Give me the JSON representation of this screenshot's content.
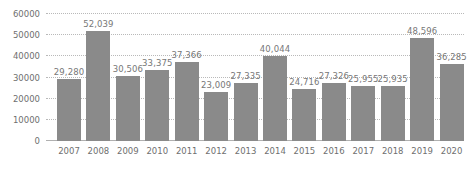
{
  "chart_data": {
    "type": "bar",
    "title": "",
    "xlabel": "",
    "ylabel": "",
    "grid": true,
    "legend": null,
    "ylim": [
      0,
      60000
    ],
    "yticks": [
      0,
      10000,
      20000,
      30000,
      40000,
      50000,
      60000
    ],
    "ytick_labels": [
      "0",
      "10000",
      "20000",
      "30000",
      "40000",
      "50000",
      "60000"
    ],
    "bar_color": "#8a8a8a",
    "label_color": "#777777",
    "grid_color": "#b9b9b9",
    "categories": [
      "2007",
      "2008",
      "2009",
      "2010",
      "2011",
      "2012",
      "2013",
      "2014",
      "2015",
      "2016",
      "2017",
      "2018",
      "2019",
      "2020"
    ],
    "values": [
      29280,
      52039,
      30506,
      33375,
      37366,
      23009,
      27335,
      40044,
      24716,
      27326,
      25955,
      25935,
      48596,
      36285
    ],
    "value_labels": [
      "29,280",
      "52,039",
      "30,506",
      "33,375",
      "37,366",
      "23,009",
      "27,335",
      "40,044",
      "24,716",
      "27,326",
      "25,955",
      "25,935",
      "48,596",
      "36,285"
    ]
  }
}
